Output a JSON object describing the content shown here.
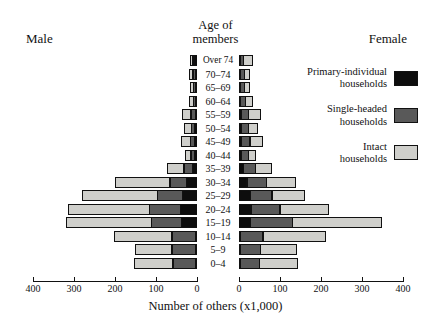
{
  "headers": {
    "male": "Male",
    "female": "Female",
    "age_line1": "Age of",
    "age_line2": "members"
  },
  "legend": [
    {
      "name": "primary-individual",
      "line1": "Primary-individual",
      "line2": "households",
      "color": "#0d0d0d"
    },
    {
      "name": "single-headed",
      "line1": "Single-headed",
      "line2": "households",
      "color": "#595959"
    },
    {
      "name": "intact",
      "line1": "Intact",
      "line2": "households",
      "color": "#cfcfcb"
    }
  ],
  "axis": {
    "xlabel": "Number of others (x1,000)",
    "male_ticks": [
      "400",
      "300",
      "200",
      "100",
      "0"
    ],
    "female_ticks": [
      "0",
      "100",
      "200",
      "300",
      "400"
    ]
  },
  "chart_data": {
    "type": "bar",
    "subtype": "population-pyramid-stacked",
    "title": "",
    "xlabel": "Number of others (x1,000)",
    "ylabel": "Age of members",
    "xlim": [
      0,
      400
    ],
    "grid": false,
    "legend_position": "right",
    "left_panel_label": "Male",
    "right_panel_label": "Female",
    "categories": [
      "Over 74",
      "70–74",
      "65–69",
      "60–64",
      "55–59",
      "50–54",
      "45–49",
      "40–44",
      "35–39",
      "30–34",
      "25–29",
      "20–24",
      "15–19",
      "10–14",
      "5–9",
      "0–4"
    ],
    "series": [
      {
        "name": "Primary-individual households",
        "color": "#0d0d0d",
        "male": [
          8,
          6,
          5,
          5,
          7,
          8,
          8,
          9,
          14,
          28,
          38,
          42,
          40,
          5,
          3,
          3
        ],
        "female": [
          6,
          5,
          5,
          6,
          8,
          9,
          9,
          9,
          13,
          22,
          30,
          32,
          30,
          4,
          3,
          3
        ]
      },
      {
        "name": "Single-headed households",
        "color": "#595959",
        "male": [
          6,
          8,
          7,
          7,
          12,
          10,
          12,
          10,
          22,
          42,
          62,
          78,
          75,
          60,
          60,
          58
        ],
        "female": [
          10,
          12,
          12,
          14,
          20,
          18,
          22,
          18,
          32,
          50,
          55,
          72,
          105,
          58,
          52,
          50
        ]
      },
      {
        "name": "Intact households",
        "color": "#cfcfcb",
        "male": [
          8,
          10,
          10,
          12,
          22,
          18,
          25,
          15,
          42,
          135,
          185,
          200,
          210,
          142,
          92,
          95
        ],
        "female": [
          22,
          15,
          16,
          18,
          30,
          24,
          32,
          20,
          40,
          72,
          80,
          120,
          220,
          155,
          90,
          95
        ]
      }
    ],
    "notes": {
      "male_totals": [
        22,
        24,
        22,
        24,
        41,
        36,
        45,
        34,
        78,
        205,
        285,
        320,
        325,
        207,
        155,
        156
      ],
      "female_totals": [
        38,
        32,
        33,
        38,
        58,
        51,
        63,
        47,
        85,
        144,
        165,
        224,
        355,
        217,
        145,
        148
      ]
    }
  }
}
